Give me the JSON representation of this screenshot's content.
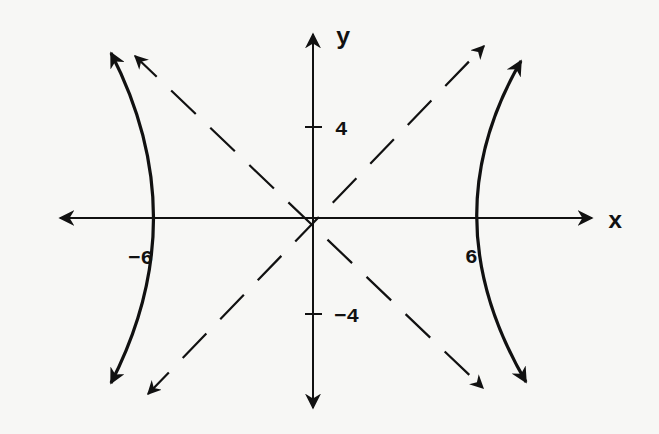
{
  "figure": {
    "type": "hyperbola-diagram",
    "axes": {
      "x_label": "x",
      "y_label": "y"
    },
    "ticks": {
      "x_neg": "−6",
      "x_pos": "6",
      "y_pos": "4",
      "y_neg": "−4"
    },
    "curve": {
      "description": "Horizontal hyperbola with vertices at (−6, 0) and (6, 0)",
      "vertices": [
        [
          -6,
          0
        ],
        [
          6,
          0
        ]
      ],
      "asymptote_style": "dashed",
      "asymptote_slopes": [
        0.667,
        -0.667
      ]
    },
    "colors": {
      "background": "#f7f7f5",
      "ink": "#111111"
    }
  }
}
